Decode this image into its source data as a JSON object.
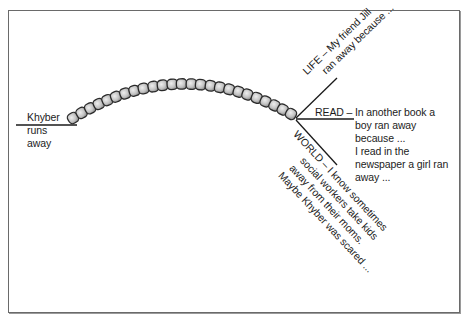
{
  "diagram": {
    "type": "bead-path fork diagram",
    "start_label": {
      "lines": [
        "Khyber",
        "runs",
        "away"
      ]
    },
    "branches": {
      "life": {
        "lines": [
          "LIFE – My friend Jill",
          "ran away because ..."
        ]
      },
      "read": {
        "tag": "READ –",
        "lines": [
          "In another book a",
          "boy ran away",
          "because ...",
          "I read in the",
          "newspaper a girl ran",
          "away ..."
        ]
      },
      "world": {
        "lines": [
          "WORLD – I know sometimes",
          "social workers take kids",
          "away from their moms.",
          "Maybe Khyber was scared ..."
        ]
      }
    },
    "bead_count": 25,
    "colors": {
      "line": "#1a1a1a",
      "bead_fill_light": "#e6e6e6",
      "bead_fill_dark": "#9a9a9a",
      "bead_stroke": "#2a2a2a",
      "frame": "#6a6a6a"
    }
  }
}
